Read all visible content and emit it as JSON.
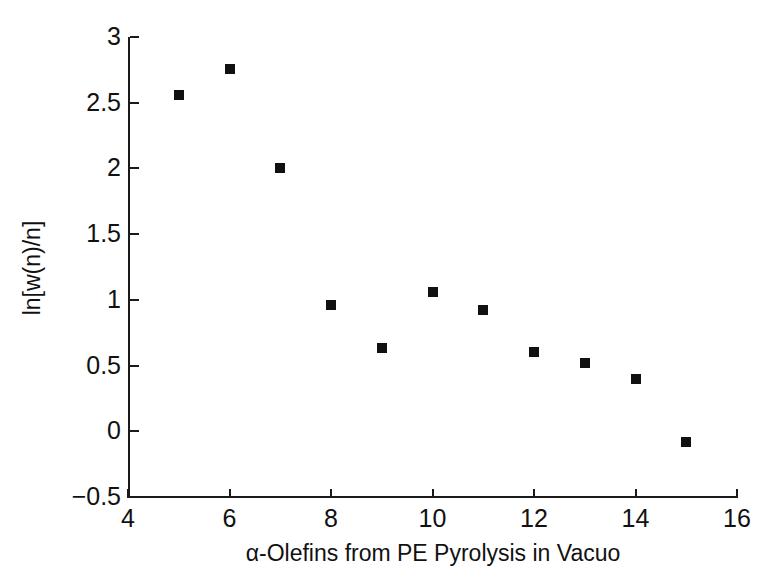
{
  "chart_data": {
    "type": "scatter",
    "title": "",
    "xlabel": "α-Olefins from PE Pyrolysis in Vacuo",
    "ylabel": "ln[w(n)/n]",
    "xlim": [
      4,
      16
    ],
    "ylim": [
      -0.5,
      3
    ],
    "grid": false,
    "legend": null,
    "marker": "filled-square",
    "marker_color": "#111111",
    "xticks": [
      4,
      6,
      8,
      10,
      12,
      14,
      16
    ],
    "xtick_labels": [
      "4",
      "6",
      "8",
      "10",
      "12",
      "14",
      "16"
    ],
    "yticks": [
      -0.5,
      0,
      0.5,
      1,
      1.5,
      2,
      2.5,
      3
    ],
    "ytick_labels": [
      "−0.5",
      "0",
      "0.5",
      "1",
      "1.5",
      "2",
      "2.5",
      "3"
    ],
    "x": [
      5,
      6,
      7,
      8,
      9,
      10,
      11,
      12,
      13,
      14,
      15
    ],
    "y": [
      2.56,
      2.76,
      2.0,
      0.96,
      0.63,
      1.06,
      0.92,
      0.6,
      0.52,
      0.4,
      -0.08
    ],
    "points": [
      {
        "x": 5,
        "y": 2.56
      },
      {
        "x": 6,
        "y": 2.76
      },
      {
        "x": 7,
        "y": 2.0
      },
      {
        "x": 8,
        "y": 0.96
      },
      {
        "x": 9,
        "y": 0.63
      },
      {
        "x": 10,
        "y": 1.06
      },
      {
        "x": 11,
        "y": 0.92
      },
      {
        "x": 12,
        "y": 0.6
      },
      {
        "x": 13,
        "y": 0.52
      },
      {
        "x": 14,
        "y": 0.4
      },
      {
        "x": 15,
        "y": -0.08
      }
    ]
  }
}
